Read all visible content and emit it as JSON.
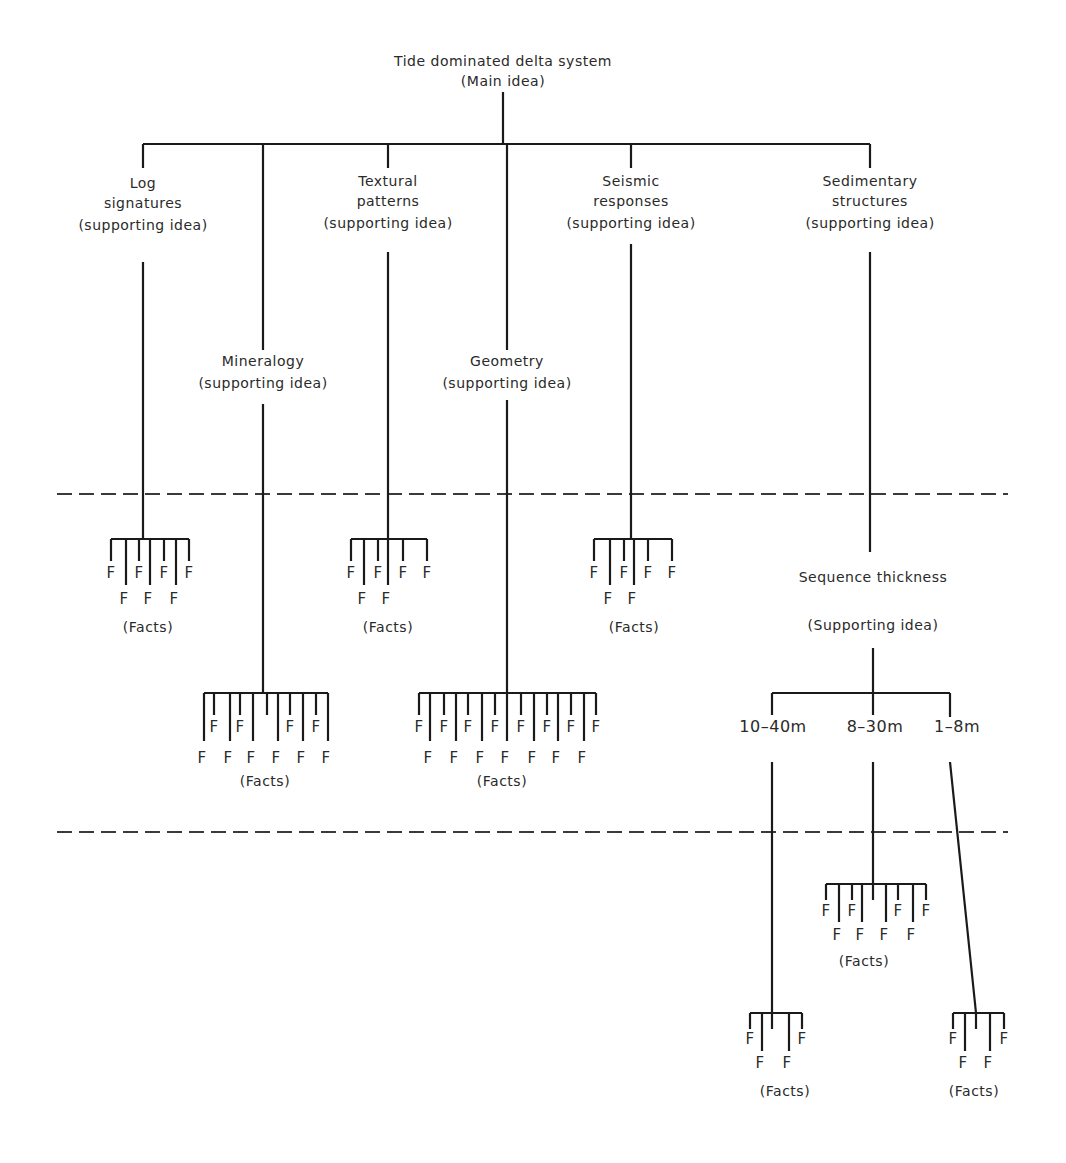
{
  "title": "Tide dominated delta system",
  "title_sub": "(Main idea)",
  "colors": {
    "line": "#1a1a1a",
    "text": "#2a2a2a",
    "background": "#ffffff"
  },
  "main": {
    "x": 503,
    "lines": [
      "Tide dominated delta system",
      "(Main idea)"
    ],
    "label_y": [
      66,
      86
    ],
    "stem": [
      92,
      144
    ]
  },
  "main_bar": {
    "y": 144,
    "x1": 143,
    "x2": 870
  },
  "dashed_lines": [
    {
      "y": 494,
      "x1": 57,
      "x2": 1008
    },
    {
      "y": 832,
      "x1": 57,
      "x2": 1008
    }
  ],
  "supporting_ideas": [
    {
      "id": "log-signatures",
      "x": 143,
      "lines": [
        "Log",
        "signatures",
        "(supporting idea)"
      ],
      "label_y": [
        188,
        208,
        230
      ],
      "drop": [
        144,
        168
      ],
      "stem": [
        262,
        540
      ]
    },
    {
      "id": "mineralogy",
      "x": 263,
      "lines": [
        "Mineralogy",
        "(supporting idea)"
      ],
      "label_y": [
        366,
        388
      ],
      "drop": [
        144,
        350
      ],
      "stem": [
        404,
        692
      ]
    },
    {
      "id": "textural-patterns",
      "x": 388,
      "lines": [
        "Textural",
        "patterns",
        "(supporting idea)"
      ],
      "label_y": [
        186,
        206,
        228
      ],
      "drop": [
        144,
        168
      ],
      "stem": [
        252,
        540
      ]
    },
    {
      "id": "geometry",
      "x": 507,
      "lines": [
        "Geometry",
        "(supporting idea)"
      ],
      "label_y": [
        366,
        388
      ],
      "drop": [
        144,
        350
      ],
      "stem": [
        400,
        692
      ]
    },
    {
      "id": "seismic-responses",
      "x": 631,
      "lines": [
        "Seismic",
        "responses",
        "(supporting idea)"
      ],
      "label_y": [
        186,
        206,
        228
      ],
      "drop": [
        144,
        168
      ],
      "stem": [
        244,
        540
      ]
    },
    {
      "id": "sedimentary-structures",
      "x": 870,
      "lines": [
        "Sedimentary",
        "structures",
        "(supporting idea)"
      ],
      "label_y": [
        186,
        206,
        228
      ],
      "drop": [
        144,
        168
      ],
      "stem": [
        252,
        552
      ]
    }
  ],
  "sequence_thickness": {
    "x": 873,
    "lines": [
      "Sequence thickness",
      "(Supporting idea)"
    ],
    "label_y": [
      582,
      630
    ],
    "stem": [
      648,
      693
    ],
    "bar": {
      "y": 693,
      "x1": 772,
      "x2": 950
    },
    "branches": [
      {
        "label": "10–40m",
        "x": 772,
        "label_x": 773,
        "label_y": 732,
        "drop": [
          693,
          715
        ],
        "stem": [
          762,
          1013
        ],
        "stem_x2": 772
      },
      {
        "label": "8–30m",
        "x": 873,
        "label_x": 875,
        "label_y": 732,
        "drop": [
          693,
          715
        ],
        "stem": [
          762,
          884
        ],
        "stem_x2": 873
      },
      {
        "label": "1–8m",
        "x": 950,
        "label_x": 957,
        "label_y": 732,
        "drop": [
          693,
          717
        ],
        "stem": [
          762,
          1013
        ],
        "stem_x2": 976
      }
    ]
  },
  "fact_groups": [
    {
      "id": "log-facts",
      "cx": 150,
      "bar_y": 539,
      "ticks": [
        111,
        126,
        139,
        150,
        164,
        176,
        189
      ],
      "long": [
        126,
        150,
        176
      ],
      "short_len": 22,
      "long_len": 46,
      "row1_y": 578,
      "row2_y": 604,
      "caption_y": 632,
      "caption": "(Facts)",
      "caption_x": 148
    },
    {
      "id": "textural-facts",
      "cx": 388,
      "bar_y": 539,
      "ticks": [
        351,
        364,
        378,
        388,
        403,
        427
      ],
      "long": [
        364,
        388
      ],
      "short_len": 22,
      "long_len": 46,
      "row1_y": 578,
      "row2_y": 604,
      "caption_y": 632,
      "caption": "(Facts)",
      "caption_x": 388
    },
    {
      "id": "seismic-facts",
      "cx": 634,
      "bar_y": 539,
      "ticks": [
        594,
        610,
        624,
        634,
        648,
        672
      ],
      "long": [
        610,
        634
      ],
      "short_len": 22,
      "long_len": 46,
      "row1_y": 578,
      "row2_y": 604,
      "caption_y": 632,
      "caption": "(Facts)",
      "caption_x": 634
    },
    {
      "id": "mineralogy-facts",
      "cx": 267,
      "bar_y": 693,
      "ticks": [
        204,
        214,
        230,
        240,
        253,
        267,
        278,
        290,
        303,
        316,
        328
      ],
      "long": [
        204,
        230,
        253,
        278,
        303,
        328
      ],
      "short_len": 22,
      "long_len": 48,
      "row1_y": 732,
      "row2_y": 763,
      "caption_y": 786,
      "caption": "(Facts)",
      "caption_x": 265
    },
    {
      "id": "geometry-facts",
      "cx": 507,
      "bar_y": 693,
      "ticks": [
        419,
        430,
        444,
        456,
        468,
        482,
        495,
        507,
        521,
        534,
        547,
        558,
        571,
        584,
        596
      ],
      "long": [
        430,
        456,
        482,
        507,
        534,
        558,
        584
      ],
      "short_len": 22,
      "long_len": 48,
      "row1_y": 732,
      "row2_y": 763,
      "caption_y": 786,
      "caption": "(Facts)",
      "caption_x": 502
    },
    {
      "id": "8-30m-facts",
      "cx": 873,
      "bar_y": 884,
      "ticks": [
        826,
        839,
        852,
        862,
        873,
        886,
        898,
        913,
        926
      ],
      "long": [
        839,
        862,
        886,
        913
      ],
      "short_len": 16,
      "long_len": 38,
      "row1_y": 916,
      "row2_y": 940,
      "caption_y": 966,
      "caption": "(Facts)",
      "caption_x": 864
    },
    {
      "id": "10-40m-facts",
      "cx": 772,
      "bar_y": 1013,
      "ticks": [
        750,
        762,
        772,
        789,
        802
      ],
      "long": [
        762,
        789
      ],
      "short_len": 16,
      "long_len": 38,
      "row1_y": 1044,
      "row2_y": 1068,
      "caption_y": 1096,
      "caption": "(Facts)",
      "caption_x": 785
    },
    {
      "id": "1-8m-facts",
      "cx": 976,
      "bar_y": 1013,
      "ticks": [
        953,
        965,
        976,
        990,
        1004
      ],
      "long": [
        965,
        990
      ],
      "short_len": 16,
      "long_len": 38,
      "row1_y": 1044,
      "row2_y": 1068,
      "caption_y": 1096,
      "caption": "(Facts)",
      "caption_x": 974
    }
  ],
  "fact_label": "F"
}
